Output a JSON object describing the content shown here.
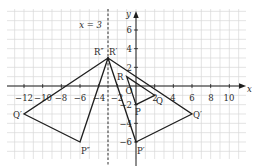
{
  "diagram": {
    "axes": {
      "x_label": "x",
      "y_label": "y",
      "x_ticks": [
        "−12",
        "−10",
        "−8",
        "−6",
        "−4",
        "−2",
        "2",
        "4",
        "6",
        "8",
        "10"
      ],
      "y_ticks": [
        "6",
        "4",
        "2",
        "−2",
        "−4",
        "−6"
      ],
      "origin_label": "O"
    },
    "mirror_line": {
      "label": "x = 3",
      "x": -3,
      "style": "dashed"
    },
    "triangles": [
      {
        "name": "PQR",
        "points": [
          {
            "label": "P",
            "x": 0,
            "y": -2
          },
          {
            "label": "Q",
            "x": 2,
            "y": -1
          },
          {
            "label": "R",
            "x": -1,
            "y": 1
          }
        ]
      },
      {
        "name": "P'Q'R'",
        "points": [
          {
            "label": "P′",
            "x": 0,
            "y": -6
          },
          {
            "label": "Q′",
            "x": 6,
            "y": -3
          },
          {
            "label": "R′",
            "x": -3,
            "y": 3
          }
        ]
      },
      {
        "name": "P''Q''R''",
        "points": [
          {
            "label": "P″",
            "x": -6,
            "y": -6
          },
          {
            "label": "Q′",
            "x": -12,
            "y": -3
          },
          {
            "label": "R″",
            "x": -3,
            "y": 3
          }
        ]
      }
    ],
    "colors": {
      "grid": "#d9d9d9",
      "ink": "#1e1e1e"
    }
  }
}
